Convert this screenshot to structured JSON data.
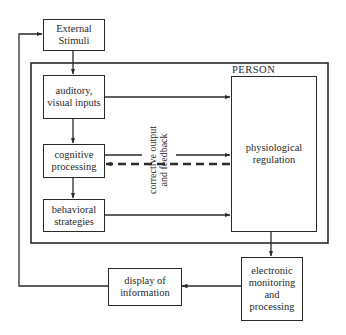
{
  "diagram": {
    "container_label": "PERSON",
    "nodes": {
      "external_stimuli": "External Stimuli",
      "auditory_visual_inputs": "auditory, visual inputs",
      "cognitive_processing": "cognitive processing",
      "behavioral_strategies": "behavioral strategies",
      "physiological_regulation": "physiological regulation",
      "electronic_monitoring": "electronic monitoring and processing",
      "display_of_information": "display of information"
    },
    "annotations": {
      "corrective_line1": "corrective output",
      "corrective_line2": "and feedback"
    },
    "edges": [
      {
        "from": "External Stimuli",
        "to": "auditory, visual inputs",
        "style": "solid"
      },
      {
        "from": "auditory, visual inputs",
        "to": "cognitive processing",
        "style": "solid"
      },
      {
        "from": "cognitive processing",
        "to": "behavioral strategies",
        "style": "solid"
      },
      {
        "from": "auditory, visual inputs",
        "to": "physiological regulation",
        "style": "solid"
      },
      {
        "from": "cognitive processing",
        "to": "physiological regulation",
        "style": "solid"
      },
      {
        "from": "physiological regulation",
        "to": "cognitive processing",
        "style": "dashed",
        "label": "corrective output and feedback"
      },
      {
        "from": "behavioral strategies",
        "to": "physiological regulation",
        "style": "solid"
      },
      {
        "from": "physiological regulation",
        "to": "electronic monitoring and processing",
        "style": "solid"
      },
      {
        "from": "electronic monitoring and processing",
        "to": "display of information",
        "style": "solid"
      },
      {
        "from": "display of information",
        "to": "External Stimuli",
        "style": "solid"
      }
    ]
  }
}
